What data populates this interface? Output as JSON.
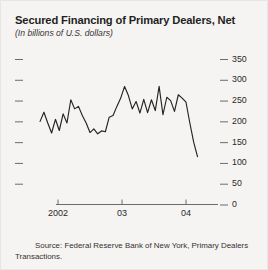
{
  "figure": {
    "title": "Secured Financing of Primary Dealers, Net",
    "subtitle": "(In billions of U.S. dollars)",
    "source": "Source: Federal Reserve Bank of New York, Primary Dealers Transactions.",
    "background_color": "#f5f4f2",
    "line_color": "#262322",
    "axis_color": "#6f6b69",
    "text_color": "#231f1e"
  },
  "chart_data": {
    "type": "line",
    "title": "Secured Financing of Primary Dealers, Net",
    "subtitle": "(In billions of U.S. dollars)",
    "xlabel": "",
    "ylabel": "In billions of U.S. dollars",
    "ylim": [
      0,
      350
    ],
    "yticks": [
      0,
      50,
      100,
      150,
      200,
      250,
      300,
      350
    ],
    "ytick_labels": [
      "0",
      "50",
      "100",
      "150",
      "200",
      "250",
      "300",
      "350"
    ],
    "ytick_side": "right",
    "xtick_labels": [
      "2002",
      "03",
      "04"
    ],
    "xtick_positions": [
      2002.0,
      2003.0,
      2004.0
    ],
    "xlim": [
      2001.72,
      2004.35
    ],
    "grid": false,
    "legend": null,
    "series": [
      {
        "name": "Secured financing of primary dealers, net",
        "x": [
          2001.72,
          2001.78,
          2001.84,
          2001.9,
          2001.96,
          2002.02,
          2002.08,
          2002.14,
          2002.2,
          2002.26,
          2002.32,
          2002.38,
          2002.44,
          2002.5,
          2002.56,
          2002.62,
          2002.68,
          2002.74,
          2002.8,
          2002.86,
          2002.92,
          2002.98,
          2003.04,
          2003.1,
          2003.16,
          2003.22,
          2003.28,
          2003.34,
          2003.4,
          2003.46,
          2003.52,
          2003.58,
          2003.64,
          2003.7,
          2003.76,
          2003.82,
          2003.88,
          2003.94,
          2004.0,
          2004.06,
          2004.12,
          2004.18
        ],
        "values": [
          200,
          222,
          196,
          172,
          205,
          178,
          218,
          196,
          252,
          230,
          236,
          214,
          196,
          173,
          182,
          170,
          177,
          175,
          210,
          214,
          236,
          256,
          284,
          262,
          230,
          248,
          220,
          253,
          221,
          252,
          226,
          284,
          216,
          258,
          250,
          224,
          264,
          256,
          246,
          196,
          150,
          115
        ]
      }
    ],
    "annotations": []
  }
}
